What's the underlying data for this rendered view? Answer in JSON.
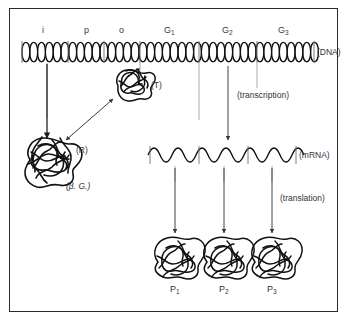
{
  "figure": {
    "title_hidden": "",
    "dna": {
      "strand_label": "(DNA)",
      "segments": [
        {
          "id": "i",
          "label": "i",
          "x_start": 22,
          "x_end": 68
        },
        {
          "id": "p",
          "label": "p",
          "x_start": 68,
          "x_end": 104
        },
        {
          "id": "o",
          "label": "o",
          "x_start": 104,
          "x_end": 140
        },
        {
          "id": "g1",
          "label": "G",
          "sub": "1",
          "x_start": 140,
          "x_end": 200
        },
        {
          "id": "g2",
          "label": "G",
          "sub": "2",
          "x_start": 200,
          "x_end": 258
        },
        {
          "id": "g3",
          "label": "G",
          "sub": "3",
          "x_start": 258,
          "x_end": 316
        }
      ]
    },
    "mrna": {
      "strand_label": "(mRNA)",
      "segment_count": 3
    },
    "molecules": [
      {
        "id": "t",
        "label": "(T)",
        "role": "inducer-bound-complex"
      },
      {
        "id": "r",
        "label": "(R)",
        "role": "repressor"
      },
      {
        "id": "bg",
        "label": "(β. G.)",
        "role": "beta-galactosidase",
        "italic": true
      }
    ],
    "proteins": [
      {
        "id": "p1",
        "label": "P",
        "sub": "1"
      },
      {
        "id": "p2",
        "label": "P",
        "sub": "2"
      },
      {
        "id": "p3",
        "label": "P",
        "sub": "3"
      }
    ],
    "process_labels": [
      {
        "id": "transcription",
        "label": "(transcription)"
      },
      {
        "id": "translation",
        "label": "(translation)"
      }
    ],
    "colors": {
      "ink": "#1b1b1b",
      "frame": "#2a2a2a",
      "text": "#333333",
      "thin_line": "#8a8a8a",
      "background": "#ffffff"
    }
  }
}
